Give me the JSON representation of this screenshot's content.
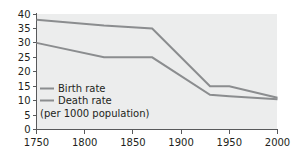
{
  "chart_data": {
    "type": "line",
    "title": "",
    "subtitle": "",
    "xlabel": "",
    "ylabel": "",
    "note": "(per 1000 population)",
    "xlim": [
      1750,
      2000
    ],
    "ylim": [
      0,
      40
    ],
    "x_ticks": [
      1750,
      1800,
      1850,
      1900,
      1950,
      2000
    ],
    "y_ticks": [
      0,
      5,
      10,
      15,
      20,
      25,
      30,
      35,
      40
    ],
    "grid": false,
    "legend_position": "inside-bottom-left",
    "series": [
      {
        "name": "Birth rate",
        "color": "#8b8d8f",
        "x": [
          1750,
          1820,
          1870,
          1930,
          1950,
          2000
        ],
        "values": [
          38,
          36,
          35,
          15,
          15,
          11
        ]
      },
      {
        "name": "Death rate",
        "color": "#8b8d8f",
        "x": [
          1750,
          1820,
          1870,
          1930,
          1950,
          2000
        ],
        "values": [
          30,
          25,
          25,
          12,
          11.5,
          10.5
        ]
      }
    ]
  },
  "axes": {
    "x_tick_labels": [
      "1750",
      "1800",
      "1850",
      "1900",
      "1950",
      "2000"
    ],
    "y_tick_labels": [
      "0",
      "5",
      "10",
      "15",
      "20",
      "25",
      "30",
      "35",
      "40"
    ]
  },
  "legend": {
    "items": [
      {
        "label": "Birth rate"
      },
      {
        "label": "Death rate"
      }
    ],
    "note": "(per 1000 population)"
  },
  "colors": {
    "series": "#8b8d8f",
    "axis": "#58595b",
    "text": "#231f20",
    "plot_background": "#eceded",
    "page_background": "#ffffff"
  }
}
